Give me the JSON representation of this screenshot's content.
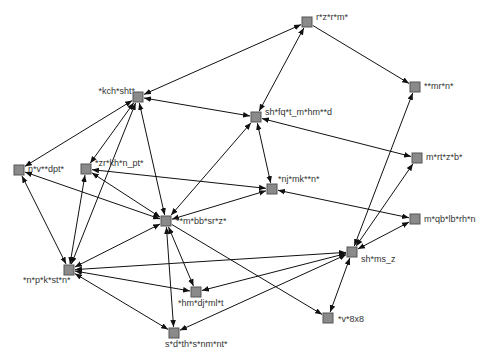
{
  "diagram": {
    "type": "directed-network-graph",
    "node_color": "#8a8a8a",
    "edge_color": "#111111",
    "nodes": [
      {
        "id": "n1",
        "label": "r*z*r*m*",
        "x": 307,
        "y": 22,
        "lx": 316,
        "ly": 20,
        "anchor": "start"
      },
      {
        "id": "n2",
        "label": "**mr*n*",
        "x": 415,
        "y": 87,
        "lx": 424,
        "ly": 89,
        "anchor": "start"
      },
      {
        "id": "n3",
        "label": "*kch*sht*",
        "x": 138,
        "y": 97,
        "lx": 135,
        "ly": 94,
        "anchor": "end"
      },
      {
        "id": "n4",
        "label": "sh*fq*t_m*hm**d",
        "x": 256,
        "y": 117,
        "lx": 265,
        "ly": 115,
        "anchor": "start"
      },
      {
        "id": "n5",
        "label": "m*rt*z*b*",
        "x": 417,
        "y": 158,
        "lx": 426,
        "ly": 160,
        "anchor": "start"
      },
      {
        "id": "n6",
        "label": "n*v**dpt*",
        "x": 19,
        "y": 170,
        "lx": 28,
        "ly": 172,
        "anchor": "start"
      },
      {
        "id": "n7",
        "label": "*zr*kh*n_pt*",
        "x": 86,
        "y": 169,
        "lx": 95,
        "ly": 166,
        "anchor": "start"
      },
      {
        "id": "n8",
        "label": "*nj*mk**n*",
        "x": 272,
        "y": 189,
        "lx": 278,
        "ly": 182,
        "anchor": "start"
      },
      {
        "id": "n9",
        "label": "m*qb*lb*rh*n",
        "x": 415,
        "y": 219,
        "lx": 424,
        "ly": 222,
        "anchor": "start"
      },
      {
        "id": "n10",
        "label": "**m*bb*sr*z*",
        "x": 166,
        "y": 221,
        "lx": 176,
        "ly": 224,
        "anchor": "start"
      },
      {
        "id": "n11",
        "label": "sh*ms_z",
        "x": 352,
        "y": 252,
        "lx": 361,
        "ly": 262,
        "anchor": "start"
      },
      {
        "id": "n12",
        "label": "*n*p*k*st*n*",
        "x": 69,
        "y": 270,
        "lx": 23,
        "ly": 283,
        "anchor": "start"
      },
      {
        "id": "n13",
        "label": "*hm*dj*ml*t",
        "x": 196,
        "y": 292,
        "lx": 178,
        "ly": 306,
        "anchor": "start"
      },
      {
        "id": "n14",
        "label": "*v*8x8",
        "x": 328,
        "y": 318,
        "lx": 338,
        "ly": 322,
        "anchor": "start"
      },
      {
        "id": "n15",
        "label": "s*d*th*s*nm*nt*",
        "x": 174,
        "y": 333,
        "lx": 165,
        "ly": 347,
        "anchor": "start"
      }
    ],
    "edges": [
      {
        "from": "n3",
        "to": "n1",
        "bidirectional": true
      },
      {
        "from": "n1",
        "to": "n4",
        "bidirectional": true
      },
      {
        "from": "n1",
        "to": "n2",
        "bidirectional": false
      },
      {
        "from": "n3",
        "to": "n6",
        "bidirectional": true
      },
      {
        "from": "n3",
        "to": "n7",
        "bidirectional": true
      },
      {
        "from": "n3",
        "to": "n4",
        "bidirectional": true
      },
      {
        "from": "n3",
        "to": "n10",
        "bidirectional": true
      },
      {
        "from": "n3",
        "to": "n12",
        "bidirectional": true
      },
      {
        "from": "n4",
        "to": "n5",
        "bidirectional": true
      },
      {
        "from": "n4",
        "to": "n8",
        "bidirectional": true
      },
      {
        "from": "n4",
        "to": "n10",
        "bidirectional": true
      },
      {
        "from": "n6",
        "to": "n10",
        "bidirectional": true
      },
      {
        "from": "n6",
        "to": "n12",
        "bidirectional": true
      },
      {
        "from": "n7",
        "to": "n8",
        "bidirectional": true
      },
      {
        "from": "n7",
        "to": "n10",
        "bidirectional": true
      },
      {
        "from": "n7",
        "to": "n12",
        "bidirectional": true
      },
      {
        "from": "n8",
        "to": "n9",
        "bidirectional": true
      },
      {
        "from": "n8",
        "to": "n10",
        "bidirectional": true
      },
      {
        "from": "n10",
        "to": "n13",
        "bidirectional": true
      },
      {
        "from": "n10",
        "to": "n15",
        "bidirectional": true
      },
      {
        "from": "n10",
        "to": "n14",
        "bidirectional": false
      },
      {
        "from": "n10",
        "to": "n12",
        "bidirectional": true
      },
      {
        "from": "n11",
        "to": "n2",
        "bidirectional": true
      },
      {
        "from": "n11",
        "to": "n5",
        "bidirectional": true
      },
      {
        "from": "n11",
        "to": "n9",
        "bidirectional": true
      },
      {
        "from": "n11",
        "to": "n12",
        "bidirectional": true
      },
      {
        "from": "n11",
        "to": "n13",
        "bidirectional": true
      },
      {
        "from": "n11",
        "to": "n14",
        "bidirectional": true
      },
      {
        "from": "n11",
        "to": "n15",
        "bidirectional": true
      },
      {
        "from": "n12",
        "to": "n15",
        "bidirectional": true
      },
      {
        "from": "n12",
        "to": "n13",
        "bidirectional": true
      }
    ]
  }
}
